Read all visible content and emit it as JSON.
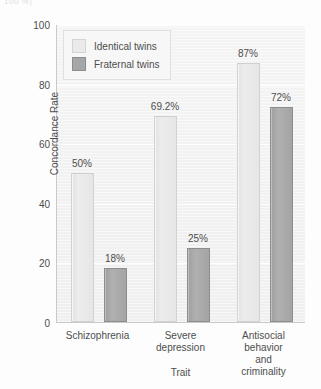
{
  "top_fragment": "100 %)",
  "chart_data": {
    "type": "bar",
    "title": "",
    "xlabel": "Trait",
    "ylabel": "Concordance Rate",
    "ylim": [
      0,
      100
    ],
    "yticks": [
      0,
      20,
      40,
      60,
      80,
      100
    ],
    "ytick_labels": [
      "0",
      "20",
      "40",
      "60",
      "80",
      "100"
    ],
    "grid": true,
    "legend_position": "upper left",
    "categories": [
      "Schizophrenia",
      "Severe\ndepression",
      "Antisocial behavior\nand criminality"
    ],
    "series": [
      {
        "name": "Identical twins",
        "color": "#eaeaea",
        "values": [
          50,
          69.2,
          87
        ],
        "data_labels": [
          "50%",
          "69.2%",
          "87%"
        ]
      },
      {
        "name": "Fraternal twins",
        "color": "#a6a6a6",
        "values": [
          18,
          25,
          72
        ],
        "data_labels": [
          "18%",
          "25%",
          "72%"
        ]
      }
    ]
  }
}
